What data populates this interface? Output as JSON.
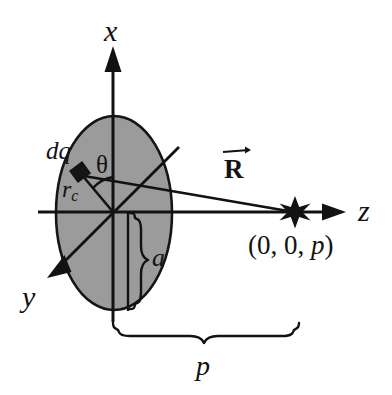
{
  "figure": {
    "type": "physics-diagram",
    "background_color": "#ffffff",
    "disk_fill_color": "#999999",
    "stroke_color": "#121212"
  },
  "axes": {
    "x_label": "x",
    "y_label": "y",
    "z_label": "z"
  },
  "labels": {
    "charge_element": "dq",
    "angle": "θ",
    "radius_to_element": "r",
    "radius_to_element_sub": "c",
    "disk_radius": "a",
    "vector_R": "R",
    "distance_p": "p",
    "field_point": "(0, 0, p)",
    "field_point_prefix": "(0, 0, ",
    "field_point_var": "p",
    "field_point_suffix": ")"
  },
  "geometry": {
    "origin": {
      "x": 113,
      "y": 212
    },
    "disk": {
      "cx": 114,
      "cy": 213,
      "rx": 58,
      "ry": 97
    },
    "field_point_marker": {
      "x": 295,
      "y": 212,
      "shape": "star"
    },
    "charge_element_marker": {
      "x": 78,
      "y": 172,
      "shape": "small-parallelogram"
    },
    "z_axis": {
      "x1": 38,
      "x2": 345,
      "y": 212
    },
    "x_axis": {
      "x": 113,
      "y1": 318,
      "y2": 47
    },
    "y_axis": {
      "x1": 178,
      "y1": 148,
      "x2": 48,
      "y2": 277
    },
    "brace_a": {
      "x": 139,
      "y_top": 213,
      "y_bottom": 311
    },
    "brace_p": {
      "x_left": 113,
      "x_right": 296,
      "y": 337
    }
  }
}
